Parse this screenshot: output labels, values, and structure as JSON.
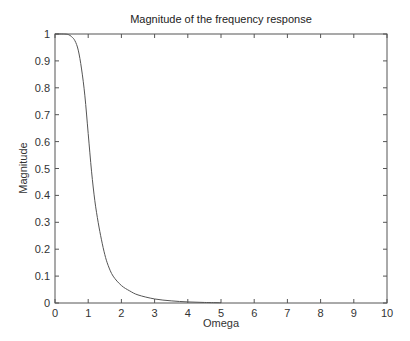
{
  "chart_data": {
    "type": "line",
    "title": "Magnitude  of the frequency response",
    "xlabel": "Omega",
    "ylabel": "Magnitude",
    "xlim": [
      0,
      10
    ],
    "ylim": [
      0,
      1
    ],
    "xticks": [
      0,
      1,
      2,
      3,
      4,
      5,
      6,
      7,
      8,
      9,
      10
    ],
    "yticks": [
      0,
      0.1,
      0.2,
      0.3,
      0.4,
      0.5,
      0.6,
      0.7,
      0.8,
      0.9,
      1
    ],
    "xtick_labels": [
      "0",
      "1",
      "2",
      "3",
      "4",
      "5",
      "6",
      "7",
      "8",
      "9",
      "10"
    ],
    "ytick_labels": [
      "0",
      "0.1",
      "0.2",
      "0.3",
      "0.4",
      "0.5",
      "0.6",
      "0.7",
      "0.8",
      "0.9",
      "1"
    ],
    "grid": false,
    "legend": null,
    "series": [
      {
        "name": "Magnitude",
        "color": "#555555",
        "x": [
          0,
          0.25,
          0.4,
          0.5,
          0.6,
          0.7,
          0.8,
          0.9,
          1.0,
          1.1,
          1.2,
          1.3,
          1.4,
          1.5,
          1.6,
          1.75,
          2.0,
          2.25,
          2.5,
          3.0,
          3.5,
          4.0,
          4.5,
          5.0
        ],
        "y": [
          1.0,
          1.0,
          0.998,
          0.99,
          0.975,
          0.94,
          0.87,
          0.77,
          0.63,
          0.49,
          0.38,
          0.3,
          0.235,
          0.18,
          0.14,
          0.1,
          0.065,
          0.045,
          0.03,
          0.015,
          0.008,
          0.004,
          0.002,
          0.001
        ]
      }
    ]
  }
}
